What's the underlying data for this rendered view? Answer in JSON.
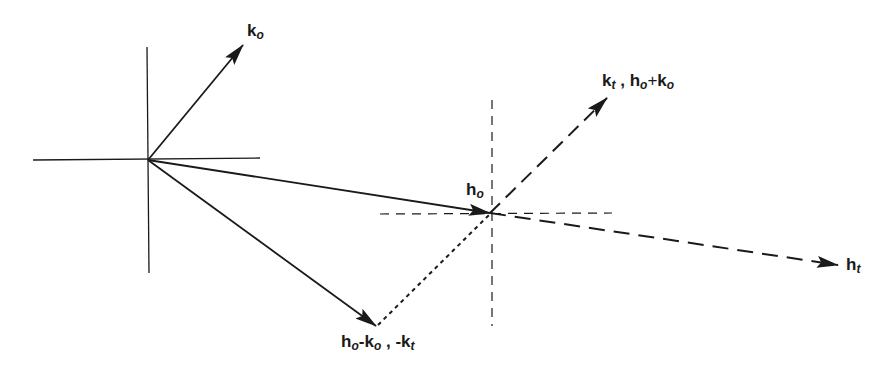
{
  "diagram": {
    "type": "vector-diagram",
    "stroke_color": "#1a1a1a",
    "origin": {
      "x": 148,
      "y": 160
    },
    "vectors": [
      {
        "id": "k_o",
        "from": [
          148,
          160
        ],
        "to": [
          243,
          45
        ],
        "style": "solid",
        "arrow": true
      },
      {
        "id": "h_o",
        "from": [
          148,
          160
        ],
        "to": [
          490,
          213
        ],
        "style": "solid",
        "arrow": true
      },
      {
        "id": "h_o_minus_k_o",
        "from": [
          148,
          160
        ],
        "to": [
          376,
          326
        ],
        "style": "solid",
        "arrow": true
      },
      {
        "id": "k_t",
        "from": [
          490,
          213
        ],
        "to": [
          607,
          98
        ],
        "style": "long-dash",
        "arrow": true
      },
      {
        "id": "h_t",
        "from": [
          490,
          213
        ],
        "to": [
          838,
          265
        ],
        "style": "long-dash",
        "arrow": true
      },
      {
        "id": "connector",
        "from": [
          376,
          326
        ],
        "to": [
          490,
          213
        ],
        "style": "dotted",
        "arrow": false
      }
    ],
    "axes": {
      "origin_cross": {
        "horizontal": [
          33,
          260
        ],
        "vertical": [
          47,
          273
        ],
        "style": "solid"
      },
      "secondary_cross": {
        "center": [
          490,
          213
        ],
        "horizontal": [
          380,
          612
        ],
        "vertical": [
          100,
          326
        ],
        "style": "dashed"
      }
    }
  },
  "labels": {
    "k_o": {
      "base": "k",
      "sub": "o"
    },
    "h_o": {
      "base": "h",
      "sub": "o"
    },
    "k_t_pair": {
      "a_base": "k",
      "a_sub": "t",
      "sep": " , ",
      "b_base": "h",
      "b_sub": "o",
      "op": "+",
      "c_base": "k",
      "c_sub": "o"
    },
    "h_t": {
      "base": "h",
      "sub": "t"
    },
    "diff": {
      "a_base": "h",
      "a_sub": "o",
      "op": "-",
      "b_base": "k",
      "b_sub": "o",
      "sep": " , ",
      "c_base": "-k",
      "c_sub": "t"
    }
  }
}
